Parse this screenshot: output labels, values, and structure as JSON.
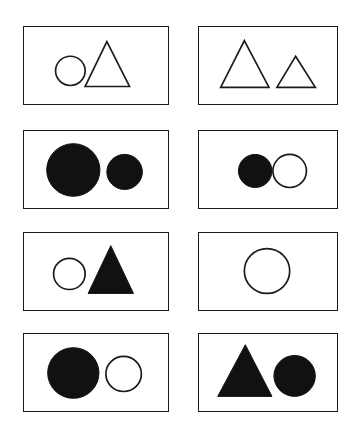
{
  "figure": {
    "background_color": "#ffffff",
    "stroke_color": "#1a1a1a",
    "fill_color": "#111111",
    "grid": {
      "rows": 4,
      "columns": 2,
      "panel_count": 8
    }
  },
  "panels": [
    {
      "id": "panel-1",
      "row": 1,
      "column": 1,
      "label": "circle outline and triangle outline",
      "box": {
        "x": 23,
        "y": 26,
        "width": 146,
        "height": 79
      },
      "shapes": [
        {
          "name": "circle",
          "style": "outline",
          "cx": 47,
          "cy": 45,
          "r": 15,
          "size": "medium"
        },
        {
          "name": "triangle",
          "style": "outline",
          "apex_x": 84,
          "apex_y": 15,
          "base_left_x": 62,
          "base_right_x": 107,
          "base_y": 61,
          "size": "large"
        }
      ]
    },
    {
      "id": "panel-2",
      "row": 1,
      "column": 2,
      "label": "large triangle outline and small triangle outline",
      "box": {
        "x": 198,
        "y": 26,
        "width": 140,
        "height": 79
      },
      "shapes": [
        {
          "name": "triangle",
          "style": "outline",
          "apex_x": 46,
          "apex_y": 14,
          "base_left_x": 22,
          "base_right_x": 71,
          "base_y": 62,
          "size": "large"
        },
        {
          "name": "triangle",
          "style": "outline",
          "apex_x": 98,
          "apex_y": 30,
          "base_left_x": 79,
          "base_right_x": 118,
          "base_y": 62,
          "size": "small"
        }
      ]
    },
    {
      "id": "panel-3",
      "row": 2,
      "column": 1,
      "label": "large filled circle and small filled circle",
      "box": {
        "x": 23,
        "y": 130,
        "width": 146,
        "height": 79
      },
      "shapes": [
        {
          "name": "circle",
          "style": "filled",
          "cx": 50,
          "cy": 40,
          "r": 27,
          "size": "large"
        },
        {
          "name": "circle",
          "style": "filled",
          "cx": 102,
          "cy": 42,
          "r": 18,
          "size": "small"
        }
      ]
    },
    {
      "id": "panel-4",
      "row": 2,
      "column": 2,
      "label": "filled circle and outlined circle",
      "box": {
        "x": 198,
        "y": 130,
        "width": 140,
        "height": 79
      },
      "shapes": [
        {
          "name": "circle",
          "style": "filled",
          "cx": 57,
          "cy": 41,
          "r": 17,
          "size": "medium"
        },
        {
          "name": "circle",
          "style": "outline",
          "cx": 92,
          "cy": 41,
          "r": 17,
          "size": "medium"
        }
      ]
    },
    {
      "id": "panel-5",
      "row": 3,
      "column": 1,
      "label": "circle outline and filled triangle",
      "box": {
        "x": 23,
        "y": 232,
        "width": 146,
        "height": 79
      },
      "shapes": [
        {
          "name": "circle",
          "style": "outline",
          "cx": 46,
          "cy": 42,
          "r": 16,
          "size": "medium"
        },
        {
          "name": "triangle",
          "style": "filled",
          "apex_x": 88,
          "apex_y": 13,
          "base_left_x": 65,
          "base_right_x": 111,
          "base_y": 62,
          "size": "large"
        }
      ]
    },
    {
      "id": "panel-6",
      "row": 3,
      "column": 2,
      "label": "single large circle outline",
      "box": {
        "x": 198,
        "y": 232,
        "width": 140,
        "height": 79
      },
      "shapes": [
        {
          "name": "circle",
          "style": "outline",
          "cx": 69,
          "cy": 39,
          "r": 23,
          "size": "large"
        }
      ]
    },
    {
      "id": "panel-7",
      "row": 4,
      "column": 1,
      "label": "large filled circle and outlined circle",
      "box": {
        "x": 23,
        "y": 333,
        "width": 146,
        "height": 79
      },
      "shapes": [
        {
          "name": "circle",
          "style": "filled",
          "cx": 50,
          "cy": 40,
          "r": 26,
          "size": "large"
        },
        {
          "name": "circle",
          "style": "outline",
          "cx": 101,
          "cy": 41,
          "r": 18,
          "size": "medium"
        }
      ]
    },
    {
      "id": "panel-8",
      "row": 4,
      "column": 2,
      "label": "filled triangle and filled circle",
      "box": {
        "x": 198,
        "y": 333,
        "width": 140,
        "height": 79
      },
      "shapes": [
        {
          "name": "triangle",
          "style": "filled",
          "apex_x": 47,
          "apex_y": 11,
          "base_left_x": 19,
          "base_right_x": 74,
          "base_y": 64,
          "size": "large"
        },
        {
          "name": "circle",
          "style": "filled",
          "cx": 97,
          "cy": 43,
          "r": 21,
          "size": "medium"
        }
      ]
    }
  ]
}
